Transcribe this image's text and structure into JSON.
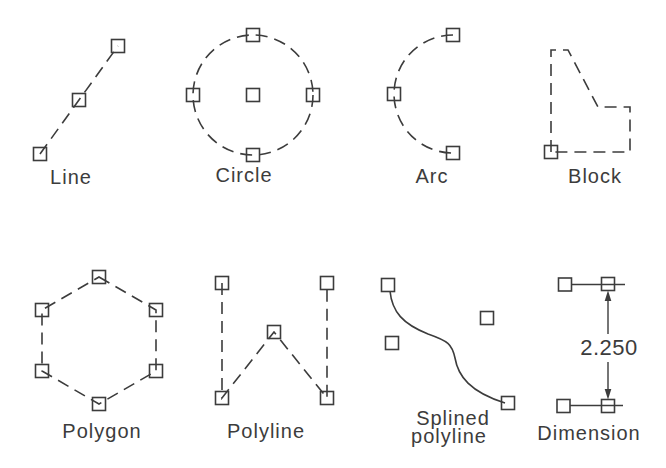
{
  "colors": {
    "ink": "#3c3c3c",
    "background": "#ffffff"
  },
  "entities": {
    "line": {
      "label": "Line"
    },
    "circle": {
      "label": "Circle"
    },
    "arc": {
      "label": "Arc"
    },
    "block": {
      "label": "Block"
    },
    "polygon": {
      "label": "Polygon"
    },
    "polyline": {
      "label": "Polyline"
    },
    "splined_polyline": {
      "label_line1": "Splined",
      "label_line2": "polyline"
    },
    "dimension": {
      "label": "Dimension",
      "value": "2.250"
    }
  }
}
